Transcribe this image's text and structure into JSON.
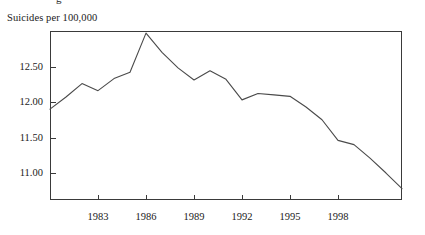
{
  "figure": {
    "axis_label": "Suicides per 100,000",
    "clipped_line_above": "g",
    "line_color": "#4a4a4a",
    "frame_color": "#3a3a3a",
    "background_color": "#ffffff"
  },
  "chart_data": {
    "type": "line",
    "title": "",
    "subtitle": "",
    "xlabel": "",
    "ylabel": "Suicides per 100,000",
    "grid": false,
    "legend": null,
    "xlim": [
      1980,
      2002
    ],
    "ylim": [
      10.62,
      13.0
    ],
    "xticks": [
      1983,
      1986,
      1989,
      1992,
      1995,
      1998
    ],
    "xtick_labels": [
      "1983",
      "1986",
      "1989",
      "1992",
      "1995",
      "1998"
    ],
    "yticks": [
      11.0,
      11.5,
      12.0,
      12.5
    ],
    "ytick_labels": [
      "11.00",
      "11.50",
      "12.00",
      "12.50"
    ],
    "x": [
      1980,
      1981,
      1982,
      1983,
      1984,
      1985,
      1986,
      1987,
      1988,
      1989,
      1990,
      1991,
      1992,
      1993,
      1994,
      1995,
      1996,
      1997,
      1998,
      1999,
      2000,
      2001,
      2002
    ],
    "values": [
      11.9,
      12.07,
      12.26,
      12.16,
      12.33,
      12.42,
      12.97,
      12.7,
      12.48,
      12.31,
      12.44,
      12.32,
      12.03,
      12.12,
      12.1,
      12.08,
      11.93,
      11.75,
      11.46,
      11.4,
      11.21,
      11.0,
      10.78
    ],
    "series": [
      {
        "name": "Suicides per 100,000",
        "values": [
          11.9,
          12.07,
          12.26,
          12.16,
          12.33,
          12.42,
          12.97,
          12.7,
          12.48,
          12.31,
          12.44,
          12.32,
          12.03,
          12.12,
          12.1,
          12.08,
          11.93,
          11.75,
          11.46,
          11.4,
          11.21,
          11.0,
          10.78
        ]
      }
    ],
    "annotations": []
  }
}
